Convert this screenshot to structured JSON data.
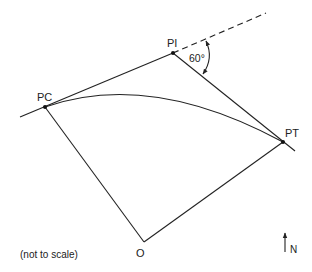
{
  "diagram": {
    "type": "horizontal circular curve",
    "points": {
      "pc": {
        "label": "PC",
        "x": 45,
        "y": 107
      },
      "pi": {
        "label": "PI",
        "x": 173,
        "y": 53
      },
      "pt": {
        "label": "PT",
        "x": 283,
        "y": 142
      },
      "o": {
        "label": "O",
        "x": 144,
        "y": 242
      }
    },
    "deflection_angle": {
      "label": "60°",
      "value_deg": 60
    },
    "north_arrow": {
      "label": "N"
    },
    "note": "(not to scale)",
    "colors": {
      "stroke": "#222222",
      "background": "#ffffff"
    }
  }
}
